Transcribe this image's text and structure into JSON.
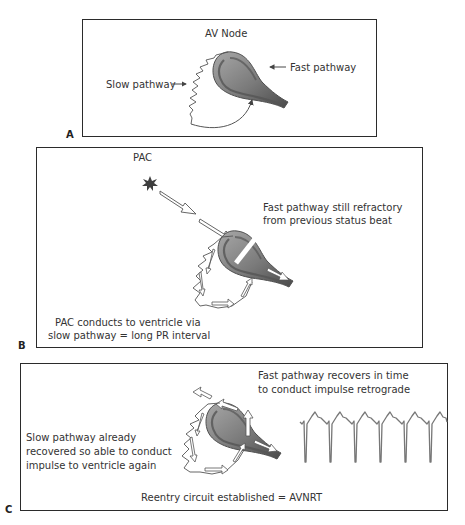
{
  "figure": {
    "panels": [
      {
        "id": "A",
        "letter": "A",
        "labels": {
          "title": "AV Node",
          "slow": "Slow pathway",
          "fast": "Fast pathway"
        }
      },
      {
        "id": "B",
        "letter": "B",
        "labels": {
          "trigger": "PAC",
          "fast_line1": "Fast pathway still refractory",
          "fast_line2": "from previous status beat",
          "slow_line1": "PAC conducts to ventricle via",
          "slow_line2": "slow pathway = long PR interval"
        }
      },
      {
        "id": "C",
        "letter": "C",
        "labels": {
          "fast_line1": "Fast pathway recovers in time",
          "fast_line2": "to conduct impulse retrograde",
          "slow_line1": "Slow pathway already",
          "slow_line2": "recovered so able to conduct",
          "slow_line3": "impulse to ventricle again",
          "footer": "Reentry circuit established = AVNRT"
        },
        "ecg_beats": 6
      }
    ],
    "colors": {
      "node_dark": "#5f5f5f",
      "node_light": "#9a9a9a",
      "line": "#555555",
      "ecg": "#777777",
      "pac_star": "#3f3f3f",
      "border": "#2b2b2b"
    }
  }
}
